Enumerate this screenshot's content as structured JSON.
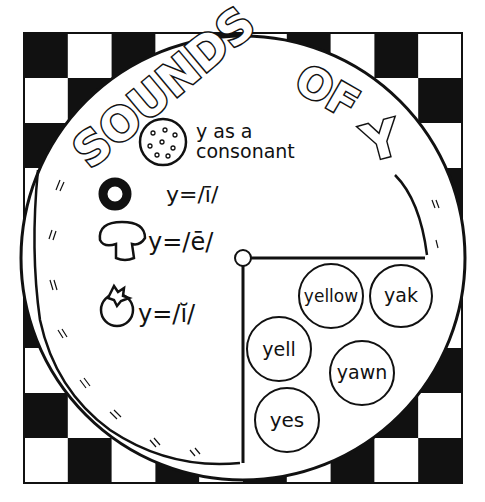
{
  "title": {
    "words": [
      "SOUNDS",
      "OF"
    ],
    "letter": "Y"
  },
  "colors": {
    "ink": "#111111",
    "paper": "#ffffff"
  },
  "legend": [
    {
      "icon": "pepperoni-cookie-icon",
      "text_line1": "y as a",
      "text_line2": "consonant"
    },
    {
      "icon": "black-olive-icon",
      "text": "y=/ī/"
    },
    {
      "icon": "mushroom-icon",
      "text": "y=/ē/"
    },
    {
      "icon": "tomato-icon",
      "text": "y=/ĭ/"
    }
  ],
  "words": [
    "yellow",
    "yak",
    "yell",
    "yawn",
    "yes"
  ],
  "board": {
    "rows": 10,
    "cols": 10
  }
}
